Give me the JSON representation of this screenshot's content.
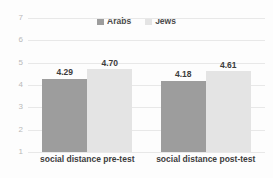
{
  "chart_data": {
    "type": "bar",
    "title": "",
    "subtitle": "",
    "xlabel": "",
    "ylabel": "",
    "categories": [
      "social distance pre-test",
      "social distance post-test"
    ],
    "series": [
      {
        "name": "Arabs",
        "color": "#9d9d9d",
        "values": [
          4.29,
          4.18
        ],
        "labels": [
          "4.29",
          "4.18"
        ]
      },
      {
        "name": "Jews",
        "color": "#e4e4e4",
        "values": [
          4.7,
          4.61
        ],
        "labels": [
          "4.70",
          "4.61"
        ]
      }
    ],
    "ylim": [
      1,
      7
    ],
    "yticks": [
      1,
      2,
      3,
      4,
      5,
      6,
      7
    ],
    "ytick_labels": [
      "1",
      "2",
      "3",
      "4",
      "5",
      "6",
      "7"
    ],
    "grid": true,
    "legend_position": "top-center",
    "gridline_color": "#e8e8e8",
    "axis_text_color": "#b9b9b9",
    "label_text_color": "#3c3c3c"
  }
}
